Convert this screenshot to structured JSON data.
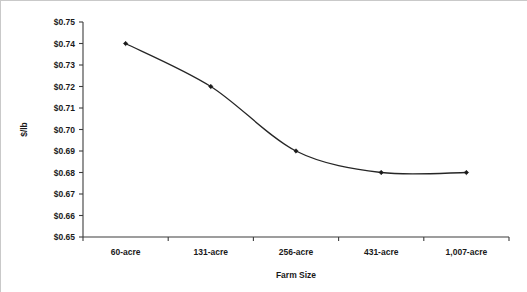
{
  "chart_data": {
    "type": "line",
    "title": "",
    "subtitle": "",
    "xlabel": "Farm Size",
    "ylabel": "$/lb",
    "categories": [
      "60-acre",
      "131-acre",
      "256-acre",
      "431-acre",
      "1,007-acre"
    ],
    "values": [
      0.74,
      0.72,
      0.69,
      0.68,
      0.68
    ],
    "series": [
      {
        "name": "",
        "values": [
          0.74,
          0.72,
          0.69,
          0.68,
          0.68
        ]
      }
    ],
    "ylim": [
      0.65,
      0.75
    ],
    "ytick_values": [
      0.75,
      0.74,
      0.73,
      0.72,
      0.71,
      0.7,
      0.69,
      0.68,
      0.67,
      0.66,
      0.65
    ],
    "ytick_labels": [
      "$0.75",
      "$0.74",
      "$0.73",
      "$0.72",
      "$0.71",
      "$0.70",
      "$0.69",
      "$0.68",
      "$0.67",
      "$0.66",
      "$0.65"
    ],
    "grid": false,
    "legend": false,
    "legend_position": "none",
    "marker": "diamond",
    "line_color": "#262626",
    "marker_color": "#1a1a1a",
    "axis_color": "#3d3d3d",
    "text_color": "#1a1a1a",
    "background_color": "#ffffff"
  }
}
